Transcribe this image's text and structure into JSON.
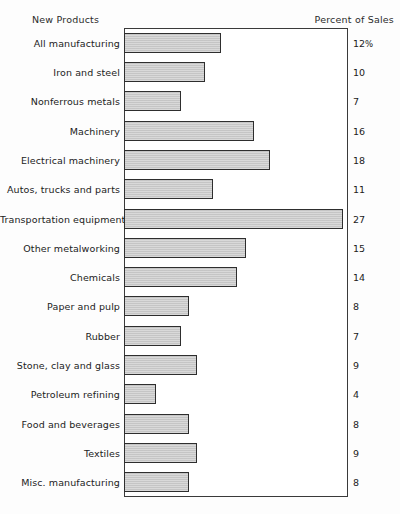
{
  "chart_data": {
    "type": "bar",
    "orientation": "horizontal",
    "title": "",
    "header_left": "New Products",
    "header_right": "Percent of Sales",
    "xlabel": "",
    "ylabel": "",
    "xlim": [
      0,
      27.7
    ],
    "grid": false,
    "legend": "none",
    "value_suffix_first": "%",
    "categories": [
      "All manufacturing",
      "Iron and steel",
      "Nonferrous metals",
      "Machinery",
      "Electrical machinery",
      "Autos, trucks and parts",
      "Transportation equipment",
      "Other metalworking",
      "Chemicals",
      "Paper and pulp",
      "Rubber",
      "Stone, clay and glass",
      "Petroleum refining",
      "Food and beverages",
      "Textiles",
      "Misc. manufacturing"
    ],
    "values": [
      12,
      10,
      7,
      16,
      18,
      11,
      27,
      15,
      14,
      8,
      7,
      9,
      4,
      8,
      9,
      8
    ],
    "value_labels": [
      "12%",
      "10",
      "7",
      "16",
      "18",
      "11",
      "27",
      "15",
      "14",
      "8",
      "7",
      "9",
      "4",
      "8",
      "9",
      "8"
    ],
    "colors": {
      "bar_fill": "#c9c9c9",
      "bar_border": "#2e2e2e",
      "frame": "#3a3a3a",
      "text": "#222222",
      "background": "#fdfdfd"
    }
  }
}
